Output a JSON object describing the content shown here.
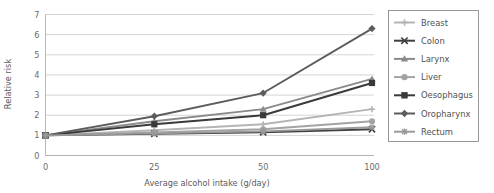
{
  "chart_data": {
    "type": "line",
    "title": "",
    "xlabel": "Average alcohol intake (g/day)",
    "ylabel": "Relative risk",
    "categories": [
      "0",
      "25",
      "50",
      "100"
    ],
    "x": [
      0,
      25,
      50,
      100
    ],
    "xlim": [
      0,
      100
    ],
    "ylim": [
      0,
      7
    ],
    "yticks": [
      0,
      1,
      2,
      3,
      4,
      5,
      6,
      7
    ],
    "ytick_labels": [
      "0",
      "1",
      "2",
      "3",
      "4",
      "5",
      "6",
      "7"
    ],
    "xtick_labels": [
      "0",
      "25",
      "50",
      "100"
    ],
    "grid": "horizontal",
    "legend_position": "right",
    "axis_scale_note": "x axis categories evenly spaced",
    "series": [
      {
        "name": "Breast",
        "values": [
          1.0,
          1.25,
          1.55,
          2.3
        ],
        "color": "#b4b4b4",
        "marker": "plus"
      },
      {
        "name": "Colon",
        "values": [
          1.0,
          1.08,
          1.15,
          1.3
        ],
        "color": "#3f3f3f",
        "marker": "cross"
      },
      {
        "name": "Larynx",
        "values": [
          1.0,
          1.7,
          2.3,
          3.8
        ],
        "color": "#8a8a8a",
        "marker": "triangle"
      },
      {
        "name": "Liver",
        "values": [
          1.0,
          1.15,
          1.3,
          1.7
        ],
        "color": "#a3a3a3",
        "marker": "circle"
      },
      {
        "name": "Oesophagus",
        "values": [
          1.0,
          1.55,
          2.0,
          3.6
        ],
        "color": "#3a3a3a",
        "marker": "square"
      },
      {
        "name": "Oropharynx",
        "values": [
          1.0,
          1.95,
          3.1,
          6.3
        ],
        "color": "#5c5c5c",
        "marker": "diamond"
      },
      {
        "name": "Rectum",
        "values": [
          1.0,
          1.1,
          1.2,
          1.4
        ],
        "color": "#9a9a9a",
        "marker": "asterisk"
      }
    ]
  },
  "legend": {
    "items": [
      {
        "label": "Breast"
      },
      {
        "label": "Colon"
      },
      {
        "label": "Larynx"
      },
      {
        "label": "Liver"
      },
      {
        "label": "Oesophagus"
      },
      {
        "label": "Oropharynx"
      },
      {
        "label": "Rectum"
      }
    ]
  },
  "colors": {
    "background": "#ffffff",
    "gridline": "#c9c9c9",
    "axis": "#b0b0b0",
    "text": "#5a5a5a",
    "legend_border": "#8d8d8d"
  }
}
